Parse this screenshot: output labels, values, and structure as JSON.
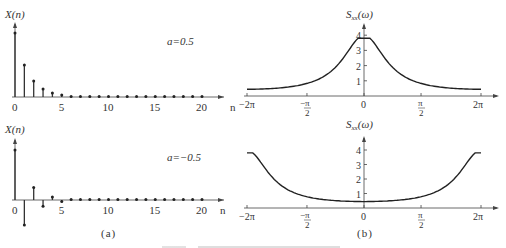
{
  "figure": {
    "panel_a_label": "(a)",
    "panel_b_label": "(b)"
  },
  "chart_data": [
    {
      "type": "stem",
      "id": "top-left",
      "ylabel": "X(n)",
      "xlabel": "n",
      "annotation": "a=0.5",
      "x": [
        0,
        1,
        2,
        3,
        4,
        5,
        6,
        7,
        8,
        9,
        10,
        11,
        12,
        13,
        14,
        15,
        16,
        17,
        18,
        19,
        20
      ],
      "values": [
        1,
        0.5,
        0.25,
        0.125,
        0.0625,
        0.03125,
        0.0156,
        0.0078,
        0.0039,
        0.002,
        0.001,
        0,
        0,
        0,
        0,
        0,
        0,
        0,
        0,
        0,
        0
      ],
      "xticks": [
        "0",
        "5",
        "10",
        "15",
        "20"
      ],
      "grid": false
    },
    {
      "type": "stem",
      "id": "bottom-left",
      "ylabel": "X(n)",
      "xlabel": "n",
      "annotation": "a=−0.5",
      "x": [
        0,
        1,
        2,
        3,
        4,
        5,
        6,
        7,
        8,
        9,
        10,
        11,
        12,
        13,
        14,
        15,
        16,
        17,
        18,
        19,
        20
      ],
      "values": [
        1,
        -0.5,
        0.25,
        -0.125,
        0.0625,
        -0.03125,
        0.0156,
        -0.0078,
        0.0039,
        -0.002,
        0.001,
        0,
        0,
        0,
        0,
        0,
        0,
        0,
        0,
        0,
        0
      ],
      "xticks": [
        "0",
        "5",
        "10",
        "15",
        "20"
      ],
      "grid": false
    },
    {
      "type": "line",
      "id": "top-right",
      "ylabel": "Sxx(ω)",
      "xticks": [
        "−2π",
        "−π/2",
        "0",
        "π/2",
        "2π"
      ],
      "yticks": [
        "1",
        "2",
        "3",
        "4"
      ],
      "ylim": [
        0,
        4.5
      ],
      "x": [
        -6.283,
        -5.498,
        -4.712,
        -3.927,
        -3.142,
        -2.356,
        -1.571,
        -0.785,
        0,
        0.785,
        1.571,
        2.356,
        3.142,
        3.927,
        4.712,
        5.498,
        6.283
      ],
      "values": [
        0.44,
        0.46,
        0.52,
        0.63,
        0.8,
        1.1,
        1.62,
        2.52,
        3.8,
        2.52,
        1.62,
        1.1,
        0.8,
        0.63,
        0.52,
        0.46,
        0.44
      ],
      "grid": false
    },
    {
      "type": "line",
      "id": "bottom-right",
      "ylabel": "Sxx(ω)",
      "xticks": [
        "−2π",
        "−π/2",
        "0",
        "π/2",
        "2π"
      ],
      "yticks": [
        "1",
        "2",
        "3",
        "4"
      ],
      "ylim": [
        0,
        4.5
      ],
      "x": [
        -6.283,
        -5.498,
        -4.712,
        -3.927,
        -3.142,
        -2.356,
        -1.571,
        -0.785,
        0,
        0.785,
        1.571,
        2.356,
        3.142,
        3.927,
        4.712,
        5.498,
        6.283
      ],
      "values": [
        3.8,
        2.52,
        1.62,
        1.1,
        0.8,
        0.63,
        0.52,
        0.46,
        0.44,
        0.46,
        0.52,
        0.63,
        0.8,
        1.1,
        1.62,
        2.52,
        3.8
      ],
      "grid": false
    }
  ]
}
